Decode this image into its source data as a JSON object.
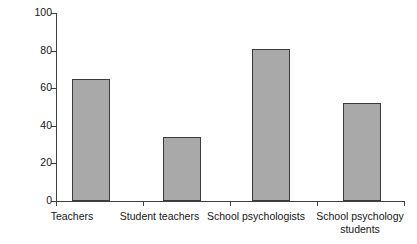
{
  "chart_data": {
    "type": "bar",
    "title": "",
    "xlabel": "",
    "ylabel": "% of participants",
    "ylim": [
      0,
      100
    ],
    "yticks": [
      0,
      20,
      40,
      60,
      80,
      100
    ],
    "grid": false,
    "legend": "none",
    "categories": [
      "Teachers",
      "Student teachers",
      "School psychologists",
      "School psychology\nstudents"
    ],
    "values": [
      65,
      34,
      81,
      52
    ],
    "bar_color": "#a9a9a9",
    "bar_edge_color": "#3b3b3b",
    "axis_color": "#404040"
  },
  "axis": {
    "y_title": "% of participants",
    "y_tick_labels": [
      "100",
      "80",
      "60",
      "40",
      "20",
      "0"
    ],
    "x_tick_labels": [
      "Teachers",
      "Student teachers",
      "School psychologists",
      "School psychology\nstudents"
    ]
  }
}
